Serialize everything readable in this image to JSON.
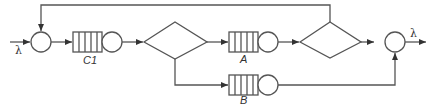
{
  "diagram": {
    "title": "",
    "type": "queueing-network",
    "stroke_color": "#555555",
    "labels": {
      "arrival_rate": "λ",
      "departure_rate": "λ",
      "queue_c1": "C1",
      "queue_a": "A",
      "queue_b": "B"
    },
    "nodes": [
      {
        "id": "join-1",
        "kind": "junction"
      },
      {
        "id": "queue-c1",
        "kind": "queue-server",
        "label": "C1"
      },
      {
        "id": "split-1",
        "kind": "decision"
      },
      {
        "id": "queue-a",
        "kind": "queue-server",
        "label": "A"
      },
      {
        "id": "queue-b",
        "kind": "queue-server",
        "label": "B"
      },
      {
        "id": "split-2",
        "kind": "decision"
      },
      {
        "id": "join-2",
        "kind": "junction"
      }
    ],
    "edges": [
      {
        "from": "input",
        "to": "join-1",
        "label": "λ"
      },
      {
        "from": "join-1",
        "to": "queue-c1"
      },
      {
        "from": "queue-c1",
        "to": "split-1"
      },
      {
        "from": "split-1",
        "to": "queue-a"
      },
      {
        "from": "split-1",
        "to": "queue-b"
      },
      {
        "from": "queue-a",
        "to": "split-2"
      },
      {
        "from": "split-2",
        "to": "join-1",
        "note": "feedback"
      },
      {
        "from": "split-2",
        "to": "join-2"
      },
      {
        "from": "queue-b",
        "to": "join-2"
      },
      {
        "from": "join-2",
        "to": "output",
        "label": "λ"
      }
    ]
  }
}
